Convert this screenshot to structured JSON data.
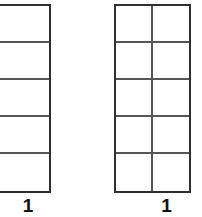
{
  "diagram": {
    "background_color": "#ffffff",
    "outer_border_color": "#2f2f2f",
    "inner_line_color": "#555555",
    "label_color": "#111111",
    "figures": [
      {
        "id": "left",
        "name": "single-column-bar",
        "columns": 1,
        "rows": 5,
        "total_cells": 5,
        "shaded_cells": 0,
        "clipped_at_left_edge": true,
        "label": "1"
      },
      {
        "id": "right",
        "name": "two-column-bar",
        "columns": 2,
        "rows": 5,
        "total_cells": 10,
        "shaded_cells": 0,
        "clipped_at_left_edge": false,
        "label": "1"
      }
    ]
  },
  "chart_data": {
    "type": "table",
    "title": "",
    "xlabel": "",
    "ylabel": "",
    "categories": [
      "left-bar",
      "right-bar"
    ],
    "series": [
      {
        "name": "columns",
        "values": [
          1,
          2
        ]
      },
      {
        "name": "rows",
        "values": [
          5,
          5
        ]
      },
      {
        "name": "total_cells",
        "values": [
          5,
          10
        ]
      }
    ],
    "annotations": [
      "1",
      "1"
    ],
    "grid": true,
    "legend": "none"
  }
}
